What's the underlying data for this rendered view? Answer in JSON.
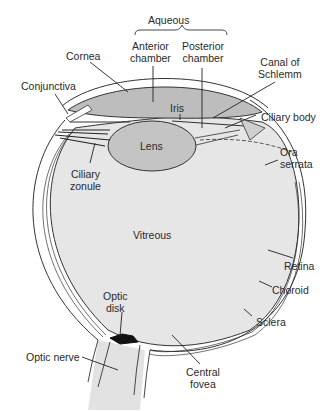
{
  "diagram": {
    "colors": {
      "background": "#ffffff",
      "vitreous_fill": "#e6e6e6",
      "aqueous_fill": "#bdbdbd",
      "lens_fill": "#c4c4c4",
      "optic_nerve_fill": "#e2e2e2",
      "outline": "#333333",
      "text": "#2a2a2a"
    },
    "labels": {
      "aqueous": "Aqueous",
      "anterior_chamber": [
        "Anterior",
        "chamber"
      ],
      "posterior_chamber": [
        "Posterior",
        "chamber"
      ],
      "cornea": "Cornea",
      "canal_of_schlemm": [
        "Canal of",
        "Schlemm"
      ],
      "conjunctiva": "Conjunctiva",
      "iris": "Iris",
      "ciliary_body": "Ciliary body",
      "lens": "Lens",
      "ora_serrata": [
        "Ora",
        "serrata"
      ],
      "ciliary_zonule": [
        "Ciliary",
        "zonule"
      ],
      "vitreous": "Vitreous",
      "retina": "Retina",
      "choroid": "Choroid",
      "optic_disk": [
        "Optic",
        "disk"
      ],
      "sclera": "Sclera",
      "optic_nerve": "Optic nerve",
      "central_fovea": [
        "Central",
        "fovea"
      ]
    }
  }
}
